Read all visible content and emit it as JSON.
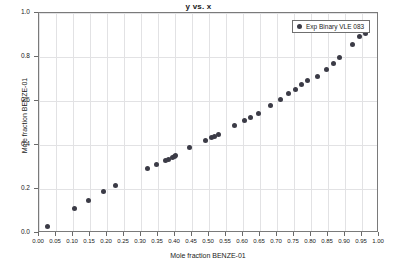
{
  "chart_data": {
    "type": "scatter",
    "title": "y vs. x",
    "xlabel": "Mole fraction BENZE-01",
    "ylabel": "Mole fraction BENZE-01",
    "xlim": [
      0.0,
      1.0
    ],
    "ylim": [
      0.0,
      1.0
    ],
    "grid": true,
    "legend_position": "top-right",
    "xticks": [
      "0.00",
      "0.05",
      "0.10",
      "0.15",
      "0.20",
      "0.25",
      "0.30",
      "0.35",
      "0.40",
      "0.45",
      "0.50",
      "0.55",
      "0.60",
      "0.65",
      "0.70",
      "0.75",
      "0.80",
      "0.85",
      "0.90",
      "0.95",
      "1.00"
    ],
    "xtick_values": [
      0.0,
      0.05,
      0.1,
      0.15,
      0.2,
      0.25,
      0.3,
      0.35,
      0.4,
      0.45,
      0.5,
      0.55,
      0.6,
      0.65,
      0.7,
      0.75,
      0.8,
      0.85,
      0.9,
      0.95,
      1.0
    ],
    "yticks": [
      "0.0",
      "0.2",
      "0.4",
      "0.6",
      "0.8",
      "1.0"
    ],
    "ytick_values": [
      0.0,
      0.2,
      0.4,
      0.6,
      0.8,
      1.0
    ],
    "series": [
      {
        "name": "Exp Binary VLE 083",
        "marker": "circle",
        "color": "#3b3b46",
        "x": [
          0.025,
          0.104,
          0.147,
          0.191,
          0.225,
          0.318,
          0.346,
          0.373,
          0.381,
          0.392,
          0.398,
          0.402,
          0.444,
          0.489,
          0.508,
          0.516,
          0.527,
          0.575,
          0.604,
          0.623,
          0.645,
          0.68,
          0.711,
          0.735,
          0.755,
          0.772,
          0.79,
          0.818,
          0.846,
          0.866,
          0.884,
          0.922,
          0.942,
          0.96
        ],
        "y": [
          0.031,
          0.111,
          0.15,
          0.188,
          0.214,
          0.291,
          0.312,
          0.331,
          0.336,
          0.345,
          0.35,
          0.353,
          0.387,
          0.42,
          0.434,
          0.44,
          0.447,
          0.487,
          0.512,
          0.527,
          0.545,
          0.578,
          0.606,
          0.634,
          0.654,
          0.675,
          0.693,
          0.712,
          0.744,
          0.772,
          0.796,
          0.856,
          0.892,
          0.908
        ]
      }
    ]
  },
  "legend": {
    "entries": [
      {
        "label": "Exp Binary VLE 083"
      }
    ]
  }
}
